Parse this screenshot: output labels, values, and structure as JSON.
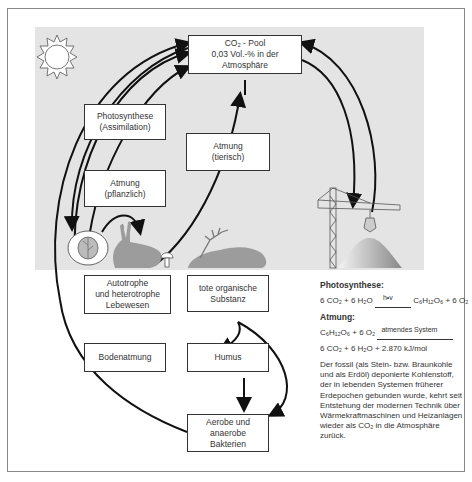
{
  "boxes": {
    "co2_pool": {
      "line1": "CO₂ - Pool",
      "line2": "0,03 Vol.-% in der",
      "line3": "Atmosphäre"
    },
    "photosynthese": {
      "line1": "Photosynthese",
      "line2": "(Assimilation)"
    },
    "atmung_pflanzlich": {
      "line1": "Atmung",
      "line2": "(pflanzlich)"
    },
    "atmung_tierisch": {
      "line1": "Atmung",
      "line2": "(tierisch)"
    },
    "lebewesen": {
      "line1": "Autotrophe",
      "line2": "und heterotrophe",
      "line3": "Lebewesen"
    },
    "tote_substanz": {
      "line1": "tote organische",
      "line2": "Substanz"
    },
    "bodenatmung": {
      "line1": "Bodenatmung"
    },
    "humus": {
      "line1": "Humus"
    },
    "bakterien": {
      "line1": "Aerobe und",
      "line2": "anaerobe",
      "line3": "Bakterien"
    }
  },
  "info": {
    "photosynthese_heading": "Photosynthese:",
    "photosynthese_left": "6 CO₂ + 6 H₂O",
    "photosynthese_arrow_label": "h•v",
    "photosynthese_right": "C₆H₁₂O₆ + 6 O₂",
    "atmung_heading": "Atmung:",
    "atmung_left": "C₆H₁₂O₆ + 6 O₂",
    "atmung_arrow_label": "atmendes System",
    "atmung_right": "6 CO₂ + 6 H₂O + 2.870 kJ/mol",
    "paragraph": "Der fossil (als Stein- bzw. Braunkohle und als Erdöl) deponierte Kohlenstoff, der in lebenden Systemen früherer Erdepochen gebunden wurde, kehrt seit Entstehung der modernen Technik über Wärmekraftmaschinen und Heizanlagen wieder als CO₂ in die Atmosphäre zurück."
  },
  "icons": [
    "sun-icon",
    "cabbage-icon",
    "rabbit-icon",
    "mushroom-icon",
    "deer-carcass-icon",
    "crane-icon",
    "coal-pile-icon"
  ]
}
